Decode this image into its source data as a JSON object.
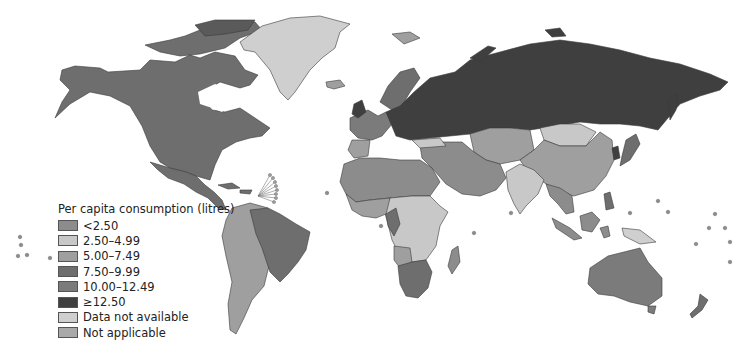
{
  "map": {
    "type": "choropleth",
    "subject": "Per capita consumption (litres)",
    "colors": {
      "lt_2_50": "#8c8c8c",
      "2_50_4_99": "#c8c8c8",
      "5_00_7_49": "#9f9f9f",
      "7_50_9_99": "#6e6e6e",
      "10_00_12_49": "#7b7b7b",
      "ge_12_50": "#3f3f3f",
      "data_not_available": "#cfcfcf",
      "not_applicable": "#a9a9a9"
    },
    "regions": [
      {
        "name": "North America (USA/Canada)",
        "category": "7.50–9.99"
      },
      {
        "name": "Greenland",
        "category": "Data not available"
      },
      {
        "name": "Mexico & Central America",
        "category": "7.50–9.99"
      },
      {
        "name": "South America (Brazil)",
        "category": "7.50–9.99"
      },
      {
        "name": "South America (others)",
        "category": "5.00–7.49"
      },
      {
        "name": "Russia & Eastern Europe",
        "category": "≥12.50"
      },
      {
        "name": "Western Europe",
        "category": "10.00–12.49"
      },
      {
        "name": "Scandinavia",
        "category": "7.50–9.99"
      },
      {
        "name": "North Africa & Middle East",
        "category": "<2.50"
      },
      {
        "name": "Central Africa",
        "category": "2.50–4.99"
      },
      {
        "name": "Southern Africa",
        "category": "7.50–9.99"
      },
      {
        "name": "China",
        "category": "5.00–7.49"
      },
      {
        "name": "Mongolia",
        "category": "2.50–4.99"
      },
      {
        "name": "India",
        "category": "2.50–4.99"
      },
      {
        "name": "Central Asia",
        "category": "5.00–7.49"
      },
      {
        "name": "Southeast Asia",
        "category": "<2.50"
      },
      {
        "name": "Australia",
        "category": "10.00–12.49"
      },
      {
        "name": "New Zealand",
        "category": "7.50–9.99"
      },
      {
        "name": "Japan",
        "category": "7.50–9.99"
      }
    ]
  },
  "legend": {
    "title": "Per capita consumption (litres)",
    "items": [
      {
        "label": "<2.50",
        "color": "#8c8c8c"
      },
      {
        "label": "2.50–4.99",
        "color": "#c8c8c8"
      },
      {
        "label": "5.00–7.49",
        "color": "#9f9f9f"
      },
      {
        "label": "7.50–9.99",
        "color": "#6e6e6e"
      },
      {
        "label": "10.00–12.49",
        "color": "#7b7b7b"
      },
      {
        "label": "≥12.50",
        "color": "#3f3f3f"
      },
      {
        "label": "Data not available",
        "color": "#cfcfcf"
      },
      {
        "label": "Not applicable",
        "color": "#a9a9a9"
      }
    ]
  }
}
